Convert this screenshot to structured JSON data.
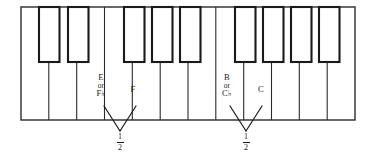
{
  "figure": {
    "background_color": "#ffffff",
    "ink_color": "#1a1a1a"
  },
  "keyboard": {
    "white_key_count": 12,
    "black_key_count": 9,
    "black_key_groups": [
      2,
      3,
      2,
      2
    ],
    "frame": {
      "x": 21,
      "y": 7,
      "width": 334,
      "height": 113
    },
    "black_key_height": 55,
    "white_key_width": 27.83
  },
  "labels": [
    {
      "id": "label-e-or-fb",
      "name": "E or F-flat",
      "lines": [
        "E",
        "or",
        "F♭"
      ],
      "x": 101,
      "y": 74,
      "pointer": {
        "from_x": 104,
        "from_y": 106,
        "to_x": 120,
        "to_y": 131
      }
    },
    {
      "id": "label-f",
      "name": "F",
      "lines": [
        "F"
      ],
      "x": 133,
      "y": 86,
      "pointer": {
        "from_x": 136,
        "from_y": 106,
        "to_x": 120,
        "to_y": 131
      }
    },
    {
      "id": "label-b-or-cb",
      "name": "B or C-flat",
      "lines": [
        "B",
        "or",
        "C♭"
      ],
      "x": 227,
      "y": 74,
      "pointer": {
        "from_x": 230,
        "from_y": 106,
        "to_x": 246,
        "to_y": 131
      }
    },
    {
      "id": "label-c",
      "name": "C",
      "lines": [
        "C"
      ],
      "x": 261,
      "y": 86,
      "pointer": {
        "from_x": 262,
        "from_y": 106,
        "to_x": 246,
        "to_y": 131
      }
    }
  ],
  "intervals": [
    {
      "id": "interval-left",
      "name": "half-step E to F",
      "numerator": "1",
      "denominator": "2",
      "x": 120,
      "y": 134
    },
    {
      "id": "interval-right",
      "name": "half-step B to C",
      "numerator": "1",
      "denominator": "2",
      "x": 246,
      "y": 134
    }
  ]
}
